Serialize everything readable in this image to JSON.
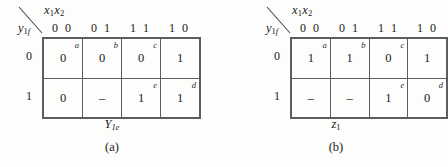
{
  "figure": {
    "panels": [
      {
        "id": "a",
        "panel_label": "(a)",
        "function_label": "Y",
        "function_sub": "1e",
        "column_variable": "x",
        "column_variable_sub1": "1",
        "column_variable_2": "x",
        "column_variable_sub2": "2",
        "row_variable": "y",
        "row_variable_sub": "1",
        "row_variable_sub_italic": "f",
        "column_headers": [
          "0 0",
          "0 1",
          "1 1",
          "1 0"
        ],
        "row_headers": [
          "0",
          "1"
        ],
        "rows": [
          {
            "header": "0",
            "cells": [
              {
                "value": "0",
                "tag": "a"
              },
              {
                "value": "0",
                "tag": "b"
              },
              {
                "value": "0",
                "tag": "c"
              },
              {
                "value": "1",
                "tag": ""
              }
            ]
          },
          {
            "header": "1",
            "cells": [
              {
                "value": "0",
                "tag": ""
              },
              {
                "value": "–",
                "tag": ""
              },
              {
                "value": "1",
                "tag": "e"
              },
              {
                "value": "1",
                "tag": "d"
              }
            ]
          }
        ]
      },
      {
        "id": "b",
        "panel_label": "(b)",
        "function_label": "z",
        "function_sub": "1",
        "column_variable": "x",
        "column_variable_sub1": "1",
        "column_variable_2": "x",
        "column_variable_sub2": "2",
        "row_variable": "y",
        "row_variable_sub": "1",
        "row_variable_sub_italic": "f",
        "column_headers": [
          "0 0",
          "0 1",
          "1 1",
          "1 0"
        ],
        "row_headers": [
          "0",
          "1"
        ],
        "rows": [
          {
            "header": "0",
            "cells": [
              {
                "value": "1",
                "tag": "a"
              },
              {
                "value": "1",
                "tag": "b"
              },
              {
                "value": "0",
                "tag": "c"
              },
              {
                "value": "1",
                "tag": ""
              }
            ]
          },
          {
            "header": "1",
            "cells": [
              {
                "value": "–",
                "tag": ""
              },
              {
                "value": "–",
                "tag": ""
              },
              {
                "value": "1",
                "tag": "e"
              },
              {
                "value": "0",
                "tag": "d"
              }
            ]
          }
        ]
      }
    ],
    "colors": {
      "page_background": "#fdfdfb",
      "grid_line": "#5d5d5d",
      "text": "#1a1a1a"
    }
  }
}
